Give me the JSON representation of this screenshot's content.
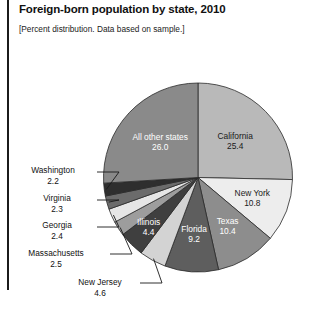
{
  "header": {
    "title": "Foreign-born population by state, 2010",
    "subtitle": "[Percent distribution. Data based on sample.]"
  },
  "chart_data": {
    "type": "pie",
    "title": "Foreign-born population by state, 2010",
    "subtitle": "[Percent distribution. Data based on sample.]",
    "unit": "percent",
    "total": 100.0,
    "legend": "none",
    "labels_position": "inside-and-leader-lines",
    "categories": [
      "California",
      "New York",
      "Texas",
      "Florida",
      "New Jersey",
      "Illinois",
      "Massachusetts",
      "Georgia",
      "Virginia",
      "Washington",
      "All other states"
    ],
    "values": [
      25.4,
      10.8,
      10.4,
      9.2,
      4.6,
      4.4,
      2.5,
      2.4,
      2.3,
      2.2,
      26.0
    ],
    "colors": [
      "#b9b9b9",
      "#ededed",
      "#8d8d8d",
      "#5e5e5e",
      "#d3d3d3",
      "#3f3f3f",
      "#9d9d9d",
      "#e6e6e6",
      "#6b6b6b",
      "#2e2e2e",
      "#8a8a8a"
    ],
    "label_colors": [
      "#1a1a1a",
      "#1a1a1a",
      "#ffffff",
      "#ffffff",
      "#1a1a1a",
      "#ffffff",
      "#1a1a1a",
      "#1a1a1a",
      "#1a1a1a",
      "#1a1a1a",
      "#ffffff"
    ],
    "slices": [
      {
        "name": "California",
        "value": 25.4,
        "label": "California",
        "value_text": "25.4",
        "placement": "inside"
      },
      {
        "name": "New York",
        "value": 10.8,
        "label": "New York",
        "value_text": "10.8",
        "placement": "inside"
      },
      {
        "name": "Texas",
        "value": 10.4,
        "label": "Texas",
        "value_text": "10.4",
        "placement": "inside"
      },
      {
        "name": "Florida",
        "value": 9.2,
        "label": "Florida",
        "value_text": "9.2",
        "placement": "inside"
      },
      {
        "name": "New Jersey",
        "value": 4.6,
        "label": "New Jersey",
        "value_text": "4.6",
        "placement": "leader"
      },
      {
        "name": "Illinois",
        "value": 4.4,
        "label": "Illinois",
        "value_text": "4.4",
        "placement": "inside"
      },
      {
        "name": "Massachusetts",
        "value": 2.5,
        "label": "Massachusetts",
        "value_text": "2.5",
        "placement": "leader"
      },
      {
        "name": "Georgia",
        "value": 2.4,
        "label": "Georgia",
        "value_text": "2.4",
        "placement": "leader"
      },
      {
        "name": "Virginia",
        "value": 2.3,
        "label": "Virginia",
        "value_text": "2.3",
        "placement": "leader"
      },
      {
        "name": "Washington",
        "value": 2.2,
        "label": "Washington",
        "value_text": "2.2",
        "placement": "leader"
      },
      {
        "name": "All other states",
        "value": 26.0,
        "label": "All other states",
        "value_text": "26.0",
        "placement": "inside"
      }
    ]
  },
  "inside_labels": {
    "california": {
      "name": "California",
      "value": "25.4"
    },
    "newyork": {
      "name": "New York",
      "value": "10.8"
    },
    "texas": {
      "name": "Texas",
      "value": "10.4"
    },
    "florida": {
      "name": "Florida",
      "value": "9.2"
    },
    "illinois": {
      "name": "Illinois",
      "value": "4.4"
    },
    "allother": {
      "name": "All other states",
      "value": "26.0"
    }
  },
  "leader_labels": {
    "washington": {
      "name": "Washington",
      "value": "2.2"
    },
    "virginia": {
      "name": "Virginia",
      "value": "2.3"
    },
    "georgia": {
      "name": "Georgia",
      "value": "2.4"
    },
    "massachusetts": {
      "name": "Massachusetts",
      "value": "2.5"
    },
    "newjersey": {
      "name": "New Jersey",
      "value": "4.6"
    }
  }
}
